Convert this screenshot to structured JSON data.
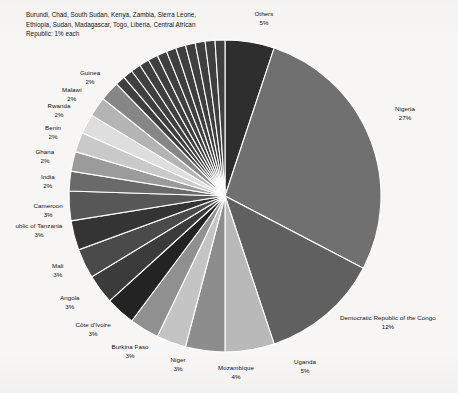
{
  "chart_data": {
    "type": "pie",
    "title": "",
    "legend_position": "callout-labels",
    "start_angle_deg": 0,
    "direction": "clockwise",
    "value_unit": "percent",
    "categories": [
      "Others",
      "Nigeria",
      "Democratic Republic of the Congo",
      "Uganda",
      "Mozambique",
      "Niger",
      "Burkina Faso",
      "Côte d'Ivoire",
      "Angola",
      "Mali",
      "United Republic of Tanzania",
      "Cameroon",
      "India",
      "Ghana",
      "Benin",
      "Rwanda",
      "Malawi",
      "Guinea",
      "Burundi",
      "Chad",
      "South Sudan",
      "Kenya",
      "Zambia",
      "Sierra Leone",
      "Ethiopia",
      "Sudan",
      "Madagascar",
      "Togo",
      "Liberia",
      "Central African Republic"
    ],
    "values": [
      5,
      27,
      12,
      5,
      4,
      3,
      3,
      3,
      3,
      3,
      3,
      3,
      2,
      2,
      2,
      2,
      2,
      2,
      1,
      1,
      1,
      1,
      1,
      1,
      1,
      1,
      1,
      1,
      1,
      1
    ],
    "colors": [
      "#2e2e2e",
      "#707070",
      "#606060",
      "#b9b9b9",
      "#8d8d8d",
      "#c4c4c4",
      "#909090",
      "#232323",
      "#3b3b3b",
      "#4a4a4a",
      "#343434",
      "#575757",
      "#6a6a6a",
      "#9b9b9b",
      "#c9c9c9",
      "#dedede",
      "#b4b4b4",
      "#868686",
      "#3f3f3f",
      "#3f3f3f",
      "#3f3f3f",
      "#3f3f3f",
      "#3f3f3f",
      "#3f3f3f",
      "#3f3f3f",
      "#3f3f3f",
      "#3f3f3f",
      "#3f3f3f",
      "#3f3f3f",
      "#3f3f3f"
    ],
    "slice_border_color": "#ffffff",
    "background_color": "#f7f6f4",
    "text_color": "#111111"
  },
  "labels": [
    {
      "name": "Others",
      "pct": "5%",
      "x": 264,
      "y": 10,
      "cls": ""
    },
    {
      "name": "Nigeria",
      "pct": "27%",
      "x": 405,
      "y": 105,
      "cls": ""
    },
    {
      "name": "Democratic Republic of the Congo",
      "pct": "12%",
      "x": 388,
      "y": 314,
      "cls": ""
    },
    {
      "name": "Uganda",
      "pct": "5%",
      "x": 305,
      "y": 358,
      "cls": ""
    },
    {
      "name": "Mozambique",
      "pct": "4%",
      "x": 236,
      "y": 364,
      "cls": ""
    },
    {
      "name": "Niger",
      "pct": "3%",
      "x": 178,
      "y": 356,
      "cls": ""
    },
    {
      "name": "Burkina Faso",
      "pct": "3%",
      "x": 130,
      "y": 343,
      "cls": ""
    },
    {
      "name": "Côte d'Ivoire",
      "pct": "3%",
      "x": 93,
      "y": 321,
      "cls": ""
    },
    {
      "name": "Angola",
      "pct": "3%",
      "x": 70,
      "y": 294,
      "cls": ""
    },
    {
      "name": "Mali",
      "pct": "3%",
      "x": 58,
      "y": 262,
      "cls": ""
    },
    {
      "name": "ublic of Tanzania",
      "pct": "3%",
      "x": 39,
      "y": 222,
      "cls": ""
    },
    {
      "name": "Cameroon",
      "pct": "3%",
      "x": 48,
      "y": 202,
      "cls": ""
    },
    {
      "name": "India",
      "pct": "2%",
      "x": 48,
      "y": 173,
      "cls": ""
    },
    {
      "name": "Ghana",
      "pct": "2%",
      "x": 45,
      "y": 148,
      "cls": ""
    },
    {
      "name": "Benin",
      "pct": "2%",
      "x": 53,
      "y": 124,
      "cls": ""
    },
    {
      "name": "Rwanda",
      "pct": "2%",
      "x": 59,
      "y": 102,
      "cls": ""
    },
    {
      "name": "Malawi",
      "pct": "2%",
      "x": 72,
      "y": 86,
      "cls": ""
    },
    {
      "name": "Guinea",
      "pct": "2%",
      "x": 90,
      "y": 69,
      "cls": ""
    }
  ],
  "note": {
    "text": "Burundi, Chad, South Sudan, Kenya, Zambia, Sierra Leone, Ethiopia, Sudan, Madagascar, Togo, Liberia, Central African Republic: 1% each",
    "x": 26,
    "y": 10
  },
  "geometry": {
    "cx": 225,
    "cy": 196,
    "r": 156
  }
}
